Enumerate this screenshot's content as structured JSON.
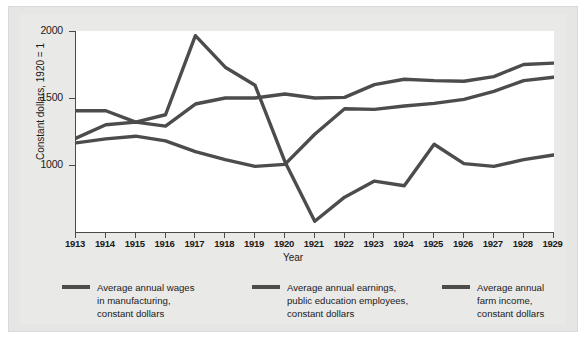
{
  "chart_data": {
    "type": "line",
    "title": "",
    "xlabel": "Year",
    "ylabel": "Constant dollars, 1920 = 1",
    "x": [
      1913,
      1914,
      1915,
      1916,
      1917,
      1918,
      1919,
      1920,
      1921,
      1922,
      1923,
      1924,
      1925,
      1926,
      1927,
      1928,
      1929
    ],
    "xtick_labels": [
      "1913",
      "1914",
      "1915",
      "1916",
      "1917",
      "1918",
      "1919",
      "1920",
      "1921",
      "1922",
      "1923",
      "1924",
      "1925",
      "1926",
      "1927",
      "1928",
      "1929"
    ],
    "ytick_labels": [
      "1000",
      "1500",
      "2000"
    ],
    "yticks": [
      1000,
      1500,
      2000
    ],
    "ylim": [
      575,
      2050
    ],
    "xlim": [
      1913,
      1929
    ],
    "grid": false,
    "legend_position": "below",
    "line_color": "#4c4c4c",
    "plot_background": "#ffffff",
    "panel_background": "#e8e8e6",
    "series": [
      {
        "name": "Average annual wages in manufacturing, constant dollars",
        "legend_label": "Average annual wages\nin manufacturing,\nconstant dollars",
        "values": [
          1200,
          1300,
          1320,
          1290,
          1455,
          1500,
          1500,
          1530,
          1500,
          1505,
          1600,
          1640,
          1630,
          1625,
          1660,
          1750,
          1760
        ]
      },
      {
        "name": "Average annual earnings, public education employees, constant dollars",
        "legend_label": "Average annual earnings,\npublic education employees,\nconstant dollars",
        "values": [
          1165,
          1195,
          1215,
          1180,
          1100,
          1040,
          990,
          1005,
          1230,
          1420,
          1415,
          1440,
          1460,
          1490,
          1550,
          1630,
          1655
        ]
      },
      {
        "name": "Average annual farm income, constant dollars",
        "legend_label": "Average annual\nfarm income,\nconstant dollars",
        "values": [
          1405,
          1405,
          1320,
          1375,
          1965,
          1730,
          1595,
          1025,
          580,
          760,
          880,
          845,
          1155,
          1010,
          990,
          1040,
          1075
        ]
      }
    ]
  },
  "axes": {
    "y_axis_title": "Constant dollars, 1920 = 1",
    "x_axis_title": "Year"
  }
}
